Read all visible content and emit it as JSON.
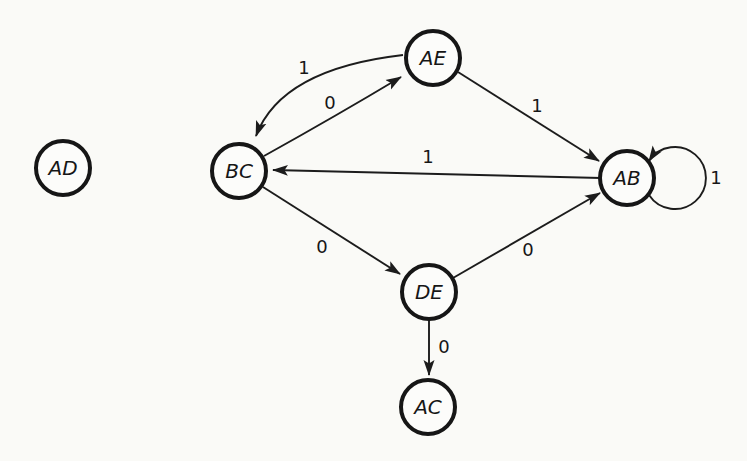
{
  "diagram": {
    "type": "state-transition-diagram",
    "background_color": "#fafaf7",
    "ink_color": "#1c1c1c",
    "nodes": [
      {
        "id": "AD",
        "label": "AD"
      },
      {
        "id": "AE",
        "label": "AE"
      },
      {
        "id": "BC",
        "label": "BC"
      },
      {
        "id": "AB",
        "label": "AB"
      },
      {
        "id": "DE",
        "label": "DE"
      },
      {
        "id": "AC",
        "label": "AC"
      }
    ],
    "edges": [
      {
        "from": "AE",
        "to": "BC",
        "label": "1",
        "style": "curved"
      },
      {
        "from": "BC",
        "to": "AE",
        "label": "0",
        "style": "straight"
      },
      {
        "from": "AE",
        "to": "AB",
        "label": "1",
        "style": "straight"
      },
      {
        "from": "AB",
        "to": "BC",
        "label": "1",
        "style": "straight"
      },
      {
        "from": "BC",
        "to": "DE",
        "label": "0",
        "style": "straight"
      },
      {
        "from": "DE",
        "to": "AB",
        "label": "0",
        "style": "straight"
      },
      {
        "from": "DE",
        "to": "AC",
        "label": "0",
        "style": "straight"
      },
      {
        "from": "AB",
        "to": "AB",
        "label": "1",
        "style": "self-loop"
      }
    ]
  }
}
